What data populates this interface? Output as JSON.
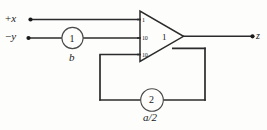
{
  "diagram": {
    "background_color": "#fdfdfc",
    "line_color": "#2b2b2b",
    "text_color": "#1a1a1a",
    "inputs": [
      {
        "id": "in-plus-x",
        "label_sign": "+",
        "label_var": "x",
        "terminal": "dot"
      },
      {
        "id": "in-minus-y",
        "label_sign": "−",
        "label_var": "y",
        "terminal": "dot"
      }
    ],
    "output": {
      "id": "out-z",
      "label": "z",
      "terminal": "dot"
    },
    "input_resistor": {
      "circle_value": "1",
      "label": "b"
    },
    "feedback_resistor": {
      "circle_value": "2",
      "label": "a/2",
      "numerator": "a",
      "slash": "/",
      "denominator": "2"
    },
    "amplifier": {
      "gain": "1",
      "pin_numbers": [
        "1",
        "10",
        "10"
      ],
      "shape": "triangle"
    }
  }
}
